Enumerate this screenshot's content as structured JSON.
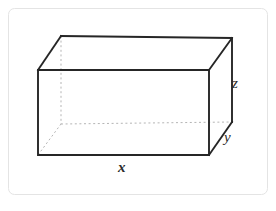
{
  "figure": {
    "kind": "geometry-diagram",
    "background_color": "#ffffff",
    "frame": {
      "name": "card-border",
      "stroke_color": "#e2e2e2",
      "fill_color": "#ffffff",
      "corner_radius": 6,
      "x": 8,
      "y": 8,
      "width": 260,
      "height": 187
    },
    "solid_stroke_color": "#262626",
    "hidden_stroke_color": "#b3b3b3",
    "solid_stroke_width": 1.9,
    "hidden_stroke_width": 1.0,
    "hidden_dash_pattern": "2,2.6"
  },
  "labels": {
    "length": {
      "text": "x",
      "edge": "front-bottom-horizontal",
      "style": "bold-italic"
    },
    "depth": {
      "text": "y",
      "edge": "right-bottom-receding",
      "style": "italic"
    },
    "height": {
      "text": "z",
      "edge": "front-right-vertical",
      "style": "italic"
    }
  },
  "geometry": {
    "front_face": {
      "top_left": [
        38,
        70
      ],
      "top_right": [
        209,
        70
      ],
      "bottom_right": [
        209,
        155
      ],
      "bottom_left": [
        38,
        155
      ]
    },
    "back_face": {
      "top_left": [
        61,
        36
      ],
      "top_right": [
        232,
        38
      ],
      "bottom_right": [
        232,
        122
      ],
      "bottom_left": [
        61,
        124
      ]
    },
    "visible_edges": [
      "front-top",
      "front-right",
      "front-bottom",
      "front-left",
      "back-top",
      "back-right",
      "top-left-receding",
      "top-right-receding",
      "bottom-right-receding"
    ],
    "hidden_edges": [
      "back-left-vertical",
      "back-bottom-horizontal",
      "bottom-left-receding"
    ]
  }
}
